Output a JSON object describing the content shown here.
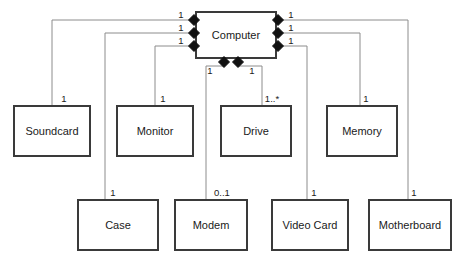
{
  "diagram": {
    "type": "uml-class-diagram",
    "colors": {
      "box_fill": "#ffffff",
      "box_stroke": "#3a3a3a",
      "connector": "#8c8c8c",
      "diamond": "#111111",
      "text": "#1a1a1a",
      "background": "#ffffff"
    },
    "whole": {
      "name": "Computer",
      "x": 196,
      "y": 12,
      "w": 80,
      "h": 46
    },
    "parts": [
      {
        "name": "Soundcard",
        "x": 14,
        "y": 106,
        "w": 76,
        "h": 50,
        "multiplicity": "1",
        "mult_x": 64,
        "mult_y": 99,
        "side": "left"
      },
      {
        "name": "Monitor",
        "x": 117,
        "y": 106,
        "w": 76,
        "h": 50,
        "multiplicity": "1",
        "mult_x": 163,
        "mult_y": 99,
        "side": "left"
      },
      {
        "name": "Drive",
        "x": 221,
        "y": 106,
        "w": 70,
        "h": 50,
        "multiplicity": "1..*",
        "mult_x": 272,
        "mult_y": 99,
        "side": "bottom"
      },
      {
        "name": "Memory",
        "x": 327,
        "y": 106,
        "w": 70,
        "h": 50,
        "multiplicity": "1",
        "mult_x": 366,
        "mult_y": 99,
        "side": "right"
      },
      {
        "name": "Case",
        "x": 78,
        "y": 200,
        "w": 80,
        "h": 50,
        "multiplicity": "1",
        "mult_x": 113,
        "mult_y": 193,
        "side": "left"
      },
      {
        "name": "Modem",
        "x": 175,
        "y": 200,
        "w": 72,
        "h": 50,
        "multiplicity": "0..1",
        "mult_x": 222,
        "mult_y": 193,
        "side": "bottom"
      },
      {
        "name": "Video Card",
        "x": 272,
        "y": 200,
        "w": 76,
        "h": 50,
        "multiplicity": "1",
        "mult_x": 314,
        "mult_y": 193,
        "side": "right"
      },
      {
        "name": "Motherboard",
        "x": 369,
        "y": 200,
        "w": 82,
        "h": 50,
        "multiplicity": "1",
        "mult_x": 414,
        "mult_y": 193,
        "side": "right"
      }
    ],
    "diamonds": [
      {
        "id": "left-top",
        "x": 194,
        "y": 20,
        "multiplicity": "1",
        "mult_x": 181,
        "mult_y": 15
      },
      {
        "id": "left-middle",
        "x": 194,
        "y": 33,
        "multiplicity": "1",
        "mult_x": 181,
        "mult_y": 28
      },
      {
        "id": "left-bottom",
        "x": 194,
        "y": 46,
        "multiplicity": "1",
        "mult_x": 181,
        "mult_y": 41
      },
      {
        "id": "right-top",
        "x": 278,
        "y": 20,
        "multiplicity": "1",
        "mult_x": 291,
        "mult_y": 15
      },
      {
        "id": "right-middle",
        "x": 278,
        "y": 33,
        "multiplicity": "1",
        "mult_x": 291,
        "mult_y": 28
      },
      {
        "id": "right-bottom",
        "x": 278,
        "y": 46,
        "multiplicity": "1",
        "mult_x": 291,
        "mult_y": 41
      },
      {
        "id": "bottom-left",
        "x": 224,
        "y": 62,
        "multiplicity": "1",
        "mult_x": 210,
        "mult_y": 71
      },
      {
        "id": "bottom-right",
        "x": 238,
        "y": 62,
        "multiplicity": "1",
        "mult_x": 252,
        "mult_y": 71
      }
    ],
    "connectors": [
      {
        "id": "computer-to-soundcard",
        "path": "M 190 20 L 52 20 L 52 106"
      },
      {
        "id": "computer-to-case",
        "path": "M 190 33 L 105 33 L 105 200"
      },
      {
        "id": "computer-to-monitor",
        "path": "M 190 46 L 155 46 L 155 106"
      },
      {
        "id": "computer-to-motherboard",
        "path": "M 282 20 L 408 20 L 408 200"
      },
      {
        "id": "computer-to-memory",
        "path": "M 282 33 L 360 33 L 360 106"
      },
      {
        "id": "computer-to-videocard",
        "path": "M 282 46 L 307 46 L 307 200"
      },
      {
        "id": "computer-to-modem",
        "path": "M 224 66 L 206 66 L 206 200"
      },
      {
        "id": "computer-to-drive",
        "path": "M 238 66 L 262 66 L 262 106"
      }
    ]
  }
}
